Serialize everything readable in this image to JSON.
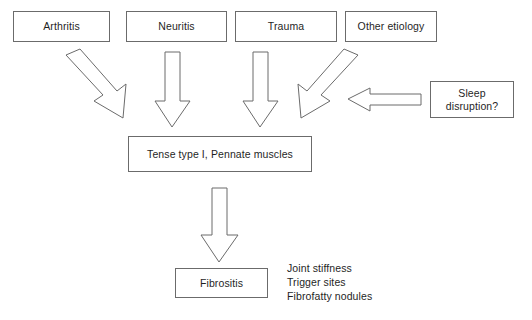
{
  "diagram": {
    "background_color": "#ffffff",
    "line_color": "#6b6b6b",
    "text_color": "#1f1f1f",
    "etiology_boxes": [
      {
        "id": "arthritis",
        "label": "Arthritis"
      },
      {
        "id": "neuritis",
        "label": "Neuritis"
      },
      {
        "id": "trauma",
        "label": "Trauma"
      },
      {
        "id": "other-etiology",
        "label": "Other etiology"
      }
    ],
    "modifier_box": {
      "id": "sleep-disruption",
      "label": "Sleep\ndisruption?"
    },
    "intermediate_box": {
      "id": "tense-muscles",
      "label": "Tense type I, Pennate muscles"
    },
    "outcome_box": {
      "id": "fibrositis",
      "label": "Fibrositis"
    },
    "symptoms": [
      "Joint stiffness",
      "Trigger sites",
      "Fibrofatty nodules"
    ],
    "arrows": [
      {
        "id": "arthritis-to-muscles",
        "direction": "diagonal-down-right"
      },
      {
        "id": "neuritis-to-muscles",
        "direction": "down"
      },
      {
        "id": "trauma-to-muscles",
        "direction": "down"
      },
      {
        "id": "other-etiology-to-muscles",
        "direction": "diagonal-down-left"
      },
      {
        "id": "sleep-disruption-to-muscles",
        "direction": "left"
      },
      {
        "id": "muscles-to-fibrositis",
        "direction": "down"
      }
    ]
  }
}
